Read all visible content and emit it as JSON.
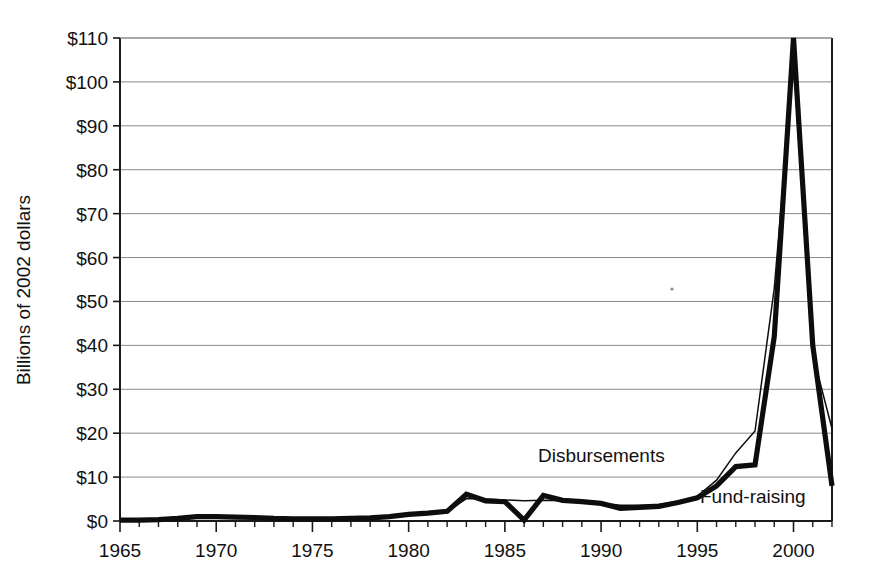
{
  "chart_data": {
    "type": "line",
    "title": "",
    "subtitle": "",
    "xlabel": "",
    "ylabel": "Billions of 2002 dollars",
    "xlim": [
      1965,
      2002
    ],
    "ylim": [
      0,
      110
    ],
    "grid": true,
    "grid_axis": "y",
    "legend_position": "inline-annotations",
    "x_tick_labels": [
      "1965",
      "1970",
      "1975",
      "1980",
      "1985",
      "1990",
      "1995",
      "2000"
    ],
    "x_tick_values": [
      1965,
      1970,
      1975,
      1980,
      1985,
      1990,
      1995,
      2000
    ],
    "x_minor_tick_step": 1,
    "y_tick_labels": [
      "$0",
      "$10",
      "$20",
      "$30",
      "$40",
      "$50",
      "$60",
      "$70",
      "$80",
      "$90",
      "$100",
      "$110"
    ],
    "y_tick_values": [
      0,
      10,
      20,
      30,
      40,
      50,
      60,
      70,
      80,
      90,
      100,
      110
    ],
    "x": [
      1965,
      1966,
      1967,
      1968,
      1969,
      1970,
      1971,
      1972,
      1973,
      1974,
      1975,
      1976,
      1977,
      1978,
      1979,
      1980,
      1981,
      1982,
      1983,
      1984,
      1985,
      1986,
      1987,
      1988,
      1989,
      1990,
      1991,
      1992,
      1993,
      1994,
      1995,
      1996,
      1997,
      1998,
      1999,
      2000,
      2001,
      2002
    ],
    "series": [
      {
        "name": "Fund-raising",
        "style": "thick",
        "label_x": 1997.2,
        "label_y": 9.0,
        "values": [
          0.2,
          0.2,
          0.3,
          0.6,
          1.0,
          1.0,
          0.9,
          0.8,
          0.6,
          0.5,
          0.5,
          0.5,
          0.6,
          0.7,
          1.0,
          1.5,
          1.8,
          2.2,
          6.1,
          4.6,
          4.4,
          0.2,
          5.8,
          4.7,
          4.4,
          4.0,
          2.9,
          3.1,
          3.3,
          4.2,
          5.3,
          8.0,
          12.4,
          12.8,
          42.0,
          110.0,
          40.0,
          8.0
        ]
      },
      {
        "name": "Disbursements",
        "style": "thin",
        "label_x": 1991.0,
        "label_y": 13.5,
        "values": [
          0.2,
          0.2,
          0.3,
          0.5,
          0.9,
          0.9,
          0.8,
          0.7,
          0.6,
          0.5,
          0.5,
          0.5,
          0.6,
          0.7,
          0.9,
          1.4,
          1.7,
          2.1,
          5.1,
          5.0,
          4.8,
          4.6,
          4.7,
          4.6,
          4.4,
          4.1,
          3.6,
          3.6,
          3.8,
          4.5,
          5.6,
          9.3,
          15.5,
          20.5,
          53.0,
          105.0,
          38.0,
          21.0
        ]
      }
    ]
  },
  "annotations": {
    "disbursements_label": "Disbursements",
    "fundraising_label": "Fund-raising"
  }
}
